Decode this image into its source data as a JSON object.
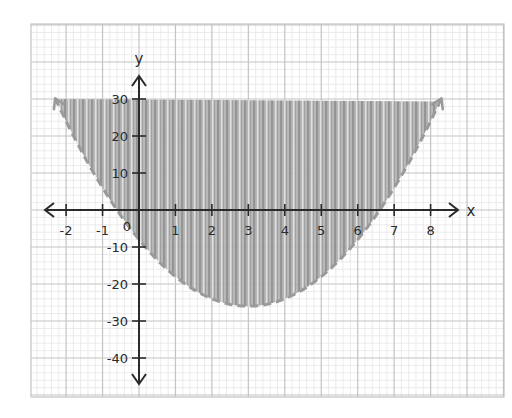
{
  "chart_data": {
    "type": "area",
    "title": "",
    "xlabel": "x",
    "ylabel": "y",
    "xlim": [
      -2.6,
      9.8
    ],
    "ylim": [
      -51,
      50
    ],
    "x_ticks": [
      -2,
      -1,
      1,
      2,
      3,
      4,
      5,
      6,
      7,
      8
    ],
    "x_tick_labels": [
      "-2",
      "-1",
      "1",
      "2",
      "3",
      "4",
      "5",
      "6",
      "7",
      "8"
    ],
    "y_ticks": [
      30,
      20,
      10,
      -10,
      -20,
      -30,
      -40
    ],
    "y_tick_labels": [
      "30",
      "20",
      "10",
      "-10",
      "-20",
      "-30",
      "-40"
    ],
    "origin_label": "0",
    "grid": true,
    "legend": null,
    "series": [
      {
        "name": "boundary",
        "kind": "parabola",
        "equation": "y = 2x^2 - 12x - 8",
        "coefficients": {
          "a": 2,
          "b": -12,
          "c": -8
        },
        "vertex": [
          3,
          -26
        ],
        "x_intercepts": [
          -0.6,
          6.6
        ],
        "line_style": "dashed",
        "arrows_at_ends": true,
        "drawn_x_range": [
          -2.3,
          8.3
        ],
        "color": "#9a9a9a"
      },
      {
        "name": "shaded-region",
        "kind": "fill",
        "inequality": "y > 2x^2 - 12x - 8",
        "region": "above boundary, clipped at y = 30",
        "fill_top_y": 30,
        "color": "#a8a8a8"
      }
    ],
    "colors": {
      "axis": "#2a2a2a",
      "major_grid": "#c4c4c4",
      "minor_grid": "#e6e6e6",
      "shading": "#a8a8a8",
      "background": "#ffffff"
    }
  }
}
